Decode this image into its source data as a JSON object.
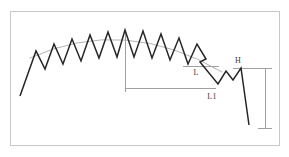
{
  "figure": {
    "canvas": {
      "width": 289,
      "height": 157
    },
    "background_color": "#ffffff",
    "border": {
      "name": "figure-border",
      "x": 10,
      "y": 11,
      "width": 269,
      "height": 134,
      "stroke_color": "#c8c8c8",
      "stroke_width": 1
    },
    "labels": [
      {
        "id": "L",
        "text": "L",
        "x": 196,
        "y": 75
      },
      {
        "id": "L1",
        "text": "L1",
        "x": 212,
        "y": 99
      },
      {
        "id": "H",
        "text": "H",
        "x": 238,
        "y": 63
      }
    ],
    "label_color": "#3a3a3a",
    "waveform": {
      "name": "zigzag-trace",
      "stroke_color": "#262626",
      "stroke_width": 1.5,
      "points": [
        [
          20,
          96
        ],
        [
          36,
          51
        ],
        [
          45,
          69
        ],
        [
          54,
          44
        ],
        [
          63,
          64
        ],
        [
          72,
          39
        ],
        [
          81,
          61
        ],
        [
          90,
          35
        ],
        [
          99,
          58
        ],
        [
          108,
          32
        ],
        [
          117,
          57
        ],
        [
          125,
          30
        ],
        [
          134,
          57
        ],
        [
          143,
          31
        ],
        [
          152,
          58
        ],
        [
          161,
          34
        ],
        [
          170,
          60
        ],
        [
          179,
          38
        ],
        [
          188,
          64
        ],
        [
          197,
          44
        ],
        [
          206,
          59
        ],
        [
          200,
          62
        ],
        [
          218,
          84
        ],
        [
          226,
          71
        ],
        [
          233,
          80
        ],
        [
          241,
          68
        ],
        [
          249,
          125
        ]
      ]
    },
    "envelope_arc": {
      "name": "envelope-arc",
      "stroke_color": "#b4b4b4",
      "stroke_width": 1,
      "start": [
        30,
        58
      ],
      "control": [
        125,
        15
      ],
      "end": [
        222,
        72
      ]
    },
    "dimensions": [
      {
        "id": "apex-vertical",
        "name": "apex-vertical-reference-line",
        "orientation": "vertical",
        "x": 125,
        "y1": 30,
        "y2": 90,
        "stroke_color": "#a0a0a0",
        "stroke_width": 1
      },
      {
        "id": "L-line",
        "name": "dimension-line-L",
        "orientation": "horizontal",
        "y": 66,
        "x1": 183,
        "x2": 219,
        "stroke_color": "#a0a0a0",
        "stroke_width": 1
      },
      {
        "id": "L1-line",
        "name": "dimension-line-L1",
        "orientation": "horizontal",
        "y": 88,
        "x1": 125,
        "x2": 216,
        "stroke_color": "#a0a0a0",
        "stroke_width": 1
      },
      {
        "id": "H-line",
        "name": "dimension-line-H",
        "orientation": "horizontal",
        "y": 68,
        "x1": 233,
        "x2": 267,
        "stroke_color": "#a0a0a0",
        "stroke_width": 1
      },
      {
        "id": "H-vertical",
        "name": "dimension-line-H-vertical",
        "orientation": "vertical",
        "x": 265,
        "y1": 68,
        "y2": 128,
        "stroke_color": "#a0a0a0",
        "stroke_width": 1
      },
      {
        "id": "H-bottom-tick",
        "name": "dimension-tick-H-bottom",
        "orientation": "horizontal",
        "y": 128,
        "x1": 258,
        "x2": 272,
        "stroke_color": "#a0a0a0",
        "stroke_width": 1
      },
      {
        "id": "H-top-tick",
        "name": "dimension-tick-H-top",
        "orientation": "horizontal",
        "y": 68,
        "x1": 258,
        "x2": 272,
        "stroke_color": "#a0a0a0",
        "stroke_width": 1
      },
      {
        "id": "L1-left-tick",
        "name": "dimension-tick-L1-left",
        "orientation": "vertical",
        "x": 125,
        "y1": 84,
        "y2": 92,
        "stroke_color": "#a0a0a0",
        "stroke_width": 1
      }
    ]
  }
}
